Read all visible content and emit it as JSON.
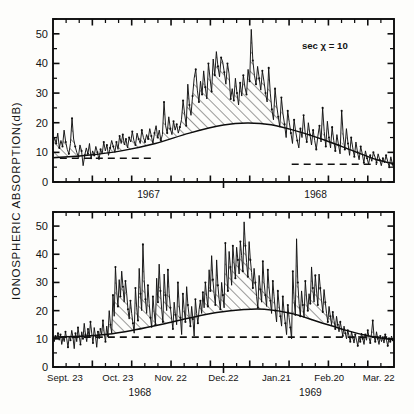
{
  "figure": {
    "ylabel": "IONOSPHERIC  ABSORPTION(dB)",
    "annotation": "sec χ = 10",
    "background": "#fdfdfb",
    "ink": "#111111"
  },
  "chart_data": [
    {
      "id": "upper-panel",
      "type": "line",
      "title": "",
      "xlabel": "",
      "ylabel": "IONOSPHERIC ABSORPTION(dB)",
      "ylim": [
        0,
        55
      ],
      "yticks": [
        0,
        10,
        20,
        30,
        40,
        50
      ],
      "ytick_labels": [
        "0",
        "10",
        "20",
        "30",
        "40",
        "50"
      ],
      "yminor_step": 5,
      "grid": false,
      "legend": null,
      "annotations": [
        {
          "text": "sec χ = 10",
          "x_frac": 0.73,
          "y_value": 45
        }
      ],
      "xlim": [
        0,
        1
      ],
      "x_year_labels": [
        {
          "label": "1967",
          "x_frac": 0.28
        },
        {
          "label": "1968",
          "x_frac": 0.77
        }
      ],
      "xticks_minor_count": 26,
      "series": [
        {
          "name": "daily absorption",
          "style": "line-with-dots",
          "values": [
            12.5,
            15.0,
            13.0,
            16.5,
            11.5,
            14.0,
            12.0,
            17.5,
            13.5,
            11.0,
            9.5,
            13.0,
            21.5,
            14.5,
            12.0,
            10.0,
            8.5,
            12.5,
            10.5,
            5.5,
            9.0,
            11.5,
            9.5,
            13.0,
            8.0,
            10.5,
            9.0,
            12.0,
            10.0,
            7.5,
            11.0,
            9.5,
            13.5,
            10.5,
            12.5,
            9.0,
            11.5,
            14.0,
            12.0,
            10.0,
            13.5,
            11.0,
            15.5,
            13.0,
            16.0,
            12.5,
            14.5,
            11.5,
            15.0,
            13.5,
            17.0,
            14.0,
            12.5,
            16.5,
            14.5,
            13.0,
            17.5,
            15.0,
            13.5,
            16.0,
            14.5,
            18.0,
            15.5,
            13.0,
            16.5,
            19.0,
            15.0,
            17.5,
            14.0,
            16.0,
            27.0,
            19.0,
            16.5,
            22.0,
            18.0,
            16.0,
            20.5,
            17.5,
            19.5,
            16.5,
            18.5,
            21.0,
            27.5,
            23.0,
            19.0,
            33.0,
            26.0,
            22.5,
            29.0,
            35.0,
            38.0,
            31.0,
            27.0,
            34.0,
            29.5,
            37.5,
            32.0,
            28.0,
            40.0,
            35.0,
            30.5,
            41.5,
            36.0,
            44.0,
            39.0,
            35.5,
            42.0,
            40.5,
            37.0,
            33.0,
            40.0,
            36.5,
            28.0,
            31.5,
            27.5,
            35.0,
            30.0,
            26.0,
            33.5,
            29.0,
            36.0,
            32.0,
            29.5,
            38.0,
            34.0,
            51.5,
            41.0,
            36.0,
            33.0,
            39.0,
            35.0,
            31.0,
            37.5,
            34.0,
            30.0,
            27.0,
            38.5,
            30.0,
            24.5,
            21.0,
            31.5,
            26.0,
            22.0,
            18.5,
            28.5,
            23.0,
            19.5,
            15.0,
            24.0,
            20.0,
            16.5,
            13.0,
            21.0,
            17.0,
            14.0,
            11.5,
            18.0,
            15.0,
            22.5,
            16.5,
            13.5,
            20.0,
            16.0,
            12.5,
            17.5,
            14.0,
            11.0,
            15.5,
            19.0,
            13.5,
            25.0,
            17.0,
            12.0,
            20.5,
            15.0,
            11.5,
            18.5,
            14.0,
            10.5,
            16.0,
            12.5,
            9.5,
            24.0,
            15.5,
            11.0,
            18.0,
            13.0,
            9.0,
            15.0,
            11.5,
            8.5,
            13.5,
            10.0,
            7.5,
            12.0,
            9.5,
            6.5,
            10.5,
            8.0,
            6.0,
            9.0,
            7.0,
            10.0,
            8.5,
            6.5,
            9.5,
            7.5,
            5.5,
            8.0,
            6.5,
            9.0,
            7.0,
            5.0,
            8.5,
            6.0,
            4.5
          ]
        },
        {
          "name": "seasonal envelope (minimum)",
          "style": "smooth-curve",
          "description": "smooth seasonal baseline rising from ~8 dB to ~20 dB peak then decaying to ~6 dB",
          "control_points": [
            {
              "x_frac": 0.0,
              "y": 8.2
            },
            {
              "x_frac": 0.1,
              "y": 9.0
            },
            {
              "x_frac": 0.2,
              "y": 10.5
            },
            {
              "x_frac": 0.3,
              "y": 13.0
            },
            {
              "x_frac": 0.4,
              "y": 16.5
            },
            {
              "x_frac": 0.5,
              "y": 19.2
            },
            {
              "x_frac": 0.57,
              "y": 19.9
            },
            {
              "x_frac": 0.64,
              "y": 19.3
            },
            {
              "x_frac": 0.72,
              "y": 17.0
            },
            {
              "x_frac": 0.8,
              "y": 14.0
            },
            {
              "x_frac": 0.88,
              "y": 10.5
            },
            {
              "x_frac": 0.95,
              "y": 7.5
            },
            {
              "x_frac": 1.0,
              "y": 6.2
            }
          ]
        }
      ],
      "reference_lines": [
        {
          "style": "dashed",
          "y": 8.0,
          "x_start_frac": 0.02,
          "x_end_frac": 0.3
        },
        {
          "style": "dashed",
          "y": 6.0,
          "x_start_frac": 0.7,
          "x_end_frac": 0.95
        }
      ],
      "fill": {
        "style": "diagonal-hatch",
        "between": [
          "seasonal envelope (minimum)",
          "daily absorption"
        ]
      }
    },
    {
      "id": "lower-panel",
      "type": "line",
      "title": "",
      "xlabel": "",
      "ylabel": "IONOSPHERIC ABSORPTION(dB)",
      "ylim": [
        0,
        55
      ],
      "yticks": [
        0,
        10,
        20,
        30,
        40,
        50
      ],
      "ytick_labels": [
        "0",
        "10",
        "20",
        "30",
        "40",
        "50"
      ],
      "yminor_step": 5,
      "grid": false,
      "legend": null,
      "xlim": [
        0,
        1
      ],
      "xtick_labels": [
        "Sept. 23",
        "Oct. 23",
        "Nov. 22",
        "Dec.22",
        "Jan.21",
        "Feb.20",
        "Mar. 22"
      ],
      "xtick_fracs": [
        0.035,
        0.19,
        0.345,
        0.5,
        0.655,
        0.81,
        0.955
      ],
      "x_year_labels": [
        {
          "label": "1968",
          "x_frac": 0.255
        },
        {
          "label": "1969",
          "x_frac": 0.755
        }
      ],
      "xticks_minor_count": 26,
      "series": [
        {
          "name": "daily absorption",
          "style": "line-with-dots",
          "values": [
            10.5,
            9.0,
            11.0,
            10.0,
            12.0,
            9.5,
            11.5,
            8.0,
            10.5,
            9.0,
            12.5,
            10.0,
            7.0,
            11.0,
            9.5,
            13.0,
            10.5,
            6.5,
            12.0,
            9.0,
            14.0,
            11.0,
            8.0,
            12.5,
            10.0,
            15.5,
            11.5,
            9.0,
            13.5,
            10.5,
            16.0,
            12.0,
            8.5,
            14.0,
            11.0,
            7.0,
            12.5,
            10.0,
            13.5,
            11.5,
            16.5,
            12.0,
            9.0,
            14.5,
            11.0,
            20.0,
            15.0,
            12.0,
            25.5,
            18.0,
            35.5,
            27.0,
            21.5,
            31.0,
            25.0,
            34.0,
            28.5,
            23.0,
            30.5,
            26.0,
            20.5,
            17.0,
            23.5,
            19.0,
            15.5,
            12.0,
            28.0,
            21.0,
            16.5,
            35.0,
            26.0,
            20.0,
            43.5,
            31.0,
            24.0,
            19.0,
            29.0,
            22.5,
            17.5,
            14.0,
            25.0,
            19.5,
            15.0,
            31.5,
            23.0,
            36.5,
            27.0,
            20.5,
            16.0,
            33.0,
            25.5,
            20.0,
            34.5,
            26.0,
            21.0,
            17.0,
            13.5,
            23.0,
            18.5,
            15.0,
            30.0,
            22.0,
            17.5,
            11.5,
            26.0,
            20.5,
            16.0,
            28.5,
            22.0,
            18.0,
            14.5,
            21.5,
            17.0,
            11.0,
            24.0,
            19.0,
            15.5,
            20.5,
            23.5,
            19.0,
            26.5,
            21.0,
            30.0,
            25.0,
            21.5,
            34.5,
            27.0,
            39.5,
            31.0,
            26.0,
            22.0,
            38.0,
            29.0,
            24.0,
            20.5,
            30.0,
            25.5,
            21.0,
            44.0,
            33.0,
            27.0,
            41.0,
            35.5,
            29.0,
            43.0,
            37.0,
            31.5,
            42.5,
            38.0,
            33.0,
            44.5,
            39.5,
            34.0,
            51.5,
            43.0,
            37.0,
            32.0,
            44.5,
            38.0,
            33.5,
            28.0,
            35.0,
            30.0,
            25.0,
            21.0,
            32.5,
            27.5,
            23.0,
            37.5,
            30.0,
            25.5,
            21.5,
            34.5,
            28.0,
            23.5,
            19.0,
            30.5,
            25.0,
            20.0,
            16.0,
            27.0,
            22.0,
            18.0,
            14.5,
            25.0,
            19.5,
            15.5,
            11.5,
            22.0,
            17.5,
            14.0,
            10.0,
            34.0,
            24.0,
            18.5,
            45.5,
            30.0,
            22.5,
            18.0,
            27.0,
            22.0,
            17.5,
            30.5,
            24.5,
            20.0,
            26.0,
            22.5,
            35.5,
            28.0,
            23.0,
            32.5,
            27.0,
            22.0,
            33.0,
            28.0,
            23.5,
            19.5,
            27.5,
            23.0,
            19.0,
            16.0,
            21.5,
            18.0,
            15.0,
            19.5,
            16.5,
            13.5,
            18.0,
            15.0,
            12.5,
            16.0,
            13.5,
            11.0,
            14.5,
            12.0,
            10.0,
            13.0,
            11.0,
            9.0,
            12.5,
            10.5,
            8.5,
            11.5,
            9.5,
            7.5,
            11.0,
            9.0,
            12.0,
            10.0,
            8.0,
            11.5,
            9.5,
            13.0,
            10.5,
            8.5,
            12.0,
            16.5,
            11.0,
            9.0,
            12.5,
            10.0,
            8.0,
            11.0,
            9.0,
            10.5,
            8.5,
            11.5,
            9.5,
            7.5,
            10.5,
            9.0,
            11.0,
            9.5,
            10.0
          ]
        },
        {
          "name": "seasonal envelope (minimum)",
          "style": "smooth-curve",
          "description": "smooth seasonal baseline rising from ~10.5 dB to ~20.5 dB peak then decaying to ~9.5 dB",
          "control_points": [
            {
              "x_frac": 0.0,
              "y": 10.6
            },
            {
              "x_frac": 0.08,
              "y": 10.9
            },
            {
              "x_frac": 0.16,
              "y": 11.6
            },
            {
              "x_frac": 0.24,
              "y": 13.2
            },
            {
              "x_frac": 0.32,
              "y": 15.2
            },
            {
              "x_frac": 0.4,
              "y": 17.4
            },
            {
              "x_frac": 0.48,
              "y": 19.3
            },
            {
              "x_frac": 0.56,
              "y": 20.4
            },
            {
              "x_frac": 0.62,
              "y": 20.5
            },
            {
              "x_frac": 0.7,
              "y": 19.0
            },
            {
              "x_frac": 0.78,
              "y": 16.0
            },
            {
              "x_frac": 0.86,
              "y": 13.0
            },
            {
              "x_frac": 0.92,
              "y": 11.2
            },
            {
              "x_frac": 1.0,
              "y": 9.6
            }
          ]
        }
      ],
      "reference_lines": [
        {
          "style": "dashed",
          "y": 10.6,
          "x_start_frac": 0.02,
          "x_end_frac": 0.98
        }
      ],
      "fill": {
        "style": "diagonal-hatch",
        "between": [
          "seasonal envelope (minimum)",
          "daily absorption"
        ]
      }
    }
  ]
}
